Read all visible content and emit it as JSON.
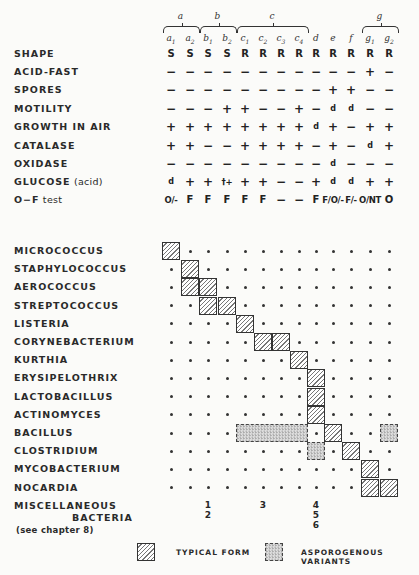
{
  "columns": {
    "groups": [
      {
        "label": "a",
        "span": [
          0,
          1
        ]
      },
      {
        "label": "b",
        "span": [
          2,
          3
        ]
      },
      {
        "label": "c",
        "span": [
          4,
          7
        ]
      },
      {
        "label": "g",
        "span": [
          11,
          12
        ]
      }
    ],
    "headers": [
      {
        "base": "a",
        "sub": "1"
      },
      {
        "base": "a",
        "sub": "2"
      },
      {
        "base": "b",
        "sub": "1"
      },
      {
        "base": "b",
        "sub": "2"
      },
      {
        "base": "c",
        "sub": "1"
      },
      {
        "base": "c",
        "sub": "2"
      },
      {
        "base": "c",
        "sub": "3"
      },
      {
        "base": "c",
        "sub": "4"
      },
      {
        "base": "d",
        "sub": ""
      },
      {
        "base": "e",
        "sub": ""
      },
      {
        "base": "f",
        "sub": ""
      },
      {
        "base": "g",
        "sub": "1"
      },
      {
        "base": "g",
        "sub": "2"
      }
    ]
  },
  "characteristics": [
    {
      "label": "SHAPE",
      "values": [
        "S",
        "S",
        "S",
        "S",
        "R",
        "R",
        "R",
        "R",
        "R",
        "R",
        "R",
        "R",
        "R"
      ]
    },
    {
      "label": "ACID-FAST",
      "values": [
        "−",
        "−",
        "−",
        "−",
        "−",
        "−",
        "−",
        "−",
        "−",
        "−",
        "−",
        "+",
        "−"
      ]
    },
    {
      "label": "SPORES",
      "values": [
        "−",
        "−",
        "−",
        "−",
        "−",
        "−",
        "−",
        "−",
        "−",
        "+",
        "+",
        "−",
        "−"
      ]
    },
    {
      "label": "MOTILITY",
      "values": [
        "−",
        "−",
        "−",
        "+",
        "+",
        "−",
        "−",
        "+",
        "−",
        "d",
        "d",
        "−",
        "−"
      ]
    },
    {
      "label": "GROWTH IN AIR",
      "values": [
        "+",
        "+",
        "+",
        "+",
        "+",
        "+",
        "+",
        "+",
        "d",
        "+",
        "−",
        "+",
        "+"
      ]
    },
    {
      "label": "CATALASE",
      "values": [
        "+",
        "+",
        "−",
        "−",
        "+",
        "+",
        "+",
        "+",
        "−",
        "+",
        "−",
        "d",
        "+"
      ]
    },
    {
      "label": "OXIDASE",
      "values": [
        "−",
        "−",
        "−",
        "−",
        "−",
        "−",
        "−",
        "−",
        "−",
        "d",
        "−",
        "−",
        "−"
      ]
    },
    {
      "label": "GLUCOSE",
      "label_suffix": "(acid)",
      "values": [
        "d",
        "+",
        "+",
        "†+",
        "+",
        "+",
        "−",
        "−",
        "+",
        "d",
        "d",
        "+",
        "+"
      ]
    },
    {
      "label": "O−F",
      "label_suffix": "test",
      "values": [
        "O/-",
        "F",
        "F",
        "F",
        "F",
        "F",
        "−",
        "−",
        "F",
        "F/O/-",
        "F/-",
        "O/NT",
        "O"
      ]
    }
  ],
  "organisms": [
    {
      "label": "MICROCOCCUS",
      "typical": [
        0
      ],
      "asporogenous": []
    },
    {
      "label": "STAPHYLOCOCCUS",
      "typical": [
        1
      ],
      "asporogenous": []
    },
    {
      "label": "AEROCOCCUS",
      "typical": [
        1,
        2
      ],
      "asporogenous": []
    },
    {
      "label": "STREPTOCOCCUS",
      "typical": [
        2,
        3
      ],
      "asporogenous": []
    },
    {
      "label": "LISTERIA",
      "typical": [
        4
      ],
      "asporogenous": []
    },
    {
      "label": "CORYNEBACTERIUM",
      "typical": [
        5,
        6
      ],
      "asporogenous": []
    },
    {
      "label": "KURTHIA",
      "typical": [
        7
      ],
      "asporogenous": []
    },
    {
      "label": "ERYSIPELOTHRIX",
      "typical": [
        8
      ],
      "asporogenous": []
    },
    {
      "label": "LACTOBACILLUS",
      "typical": [
        8
      ],
      "asporogenous": []
    },
    {
      "label": "ACTINOMYCES",
      "typical": [
        8
      ],
      "asporogenous": []
    },
    {
      "label": "BACILLUS",
      "typical": [
        9
      ],
      "asporogenous": [
        [
          4,
          7
        ],
        [
          12,
          12
        ]
      ]
    },
    {
      "label": "CLOSTRIDIUM",
      "typical": [
        10
      ],
      "asporogenous": [
        [
          8,
          8
        ]
      ]
    },
    {
      "label": "MYCOBACTERIUM",
      "typical": [
        11
      ],
      "asporogenous": []
    },
    {
      "label": "NOCARDIA",
      "typical": [
        11,
        12
      ],
      "asporogenous": []
    }
  ],
  "miscellaneous": {
    "label_line1": "MISCELLANEOUS",
    "label_line2": "BACTERIA",
    "note": "(see chapter 8)",
    "markers": [
      {
        "col": 2,
        "text": "1\n2"
      },
      {
        "col": 5,
        "text": "3"
      },
      {
        "col": 8,
        "text": "4\n5\n6"
      }
    ]
  },
  "legend": {
    "typical_label": "TYPICAL FORM",
    "asporogenous_label": "ASPOROGENOUS VARIANTS"
  }
}
